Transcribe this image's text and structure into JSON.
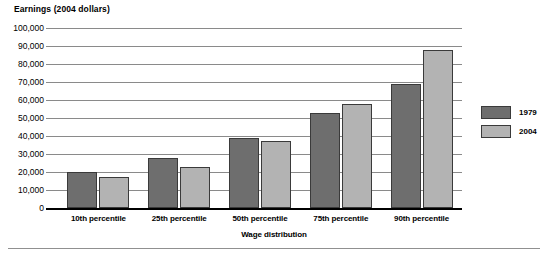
{
  "chart_data": {
    "type": "bar",
    "title": "Earnings (2004 dollars)",
    "xlabel": "Wage distribution",
    "ylabel": "",
    "categories": [
      "10th percentile",
      "25th percentile",
      "50th percentile",
      "75th percentile",
      "90th percentile"
    ],
    "series": [
      {
        "name": "1979",
        "color": "#6e6e6e",
        "values": [
          20000,
          28000,
          39000,
          53000,
          69000
        ]
      },
      {
        "name": "2004",
        "color": "#b3b3b3",
        "values": [
          17500,
          23000,
          37000,
          58000,
          88000
        ]
      }
    ],
    "ylim": [
      0,
      100000
    ],
    "ytick_values": [
      0,
      10000,
      20000,
      30000,
      40000,
      50000,
      60000,
      70000,
      80000,
      90000,
      100000
    ],
    "ytick_labels": [
      "0",
      "10,000",
      "20,000",
      "30,000",
      "40,000",
      "50,000",
      "60,000",
      "70,000",
      "80,000",
      "90,000",
      "100,000"
    ],
    "grid": true,
    "legend_position": "right"
  }
}
